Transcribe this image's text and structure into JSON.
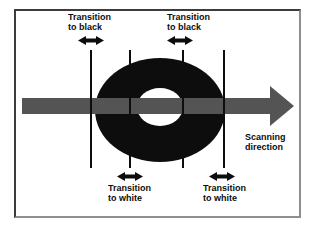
{
  "diagram": {
    "transition_labels": {
      "top_left": "Transition to black",
      "top_right": "Transition to black",
      "bottom_left": "Transition to white",
      "bottom_right": "Transition to white"
    },
    "scanning_label": "Scanning direction",
    "icons": {
      "double_arrow": "double-headed-horizontal-arrow",
      "scan_arrow": "right-pointing-arrow"
    },
    "colors": {
      "ring_fill": "#0d0d0d",
      "ring_hole": "#ffffff",
      "scan_arrow": "#545454",
      "transition_line": "#0d0d0d",
      "background": "#ffffff",
      "frame_border_dark": "#3c3c3c",
      "frame_border_light": "#8f8f8f"
    }
  }
}
